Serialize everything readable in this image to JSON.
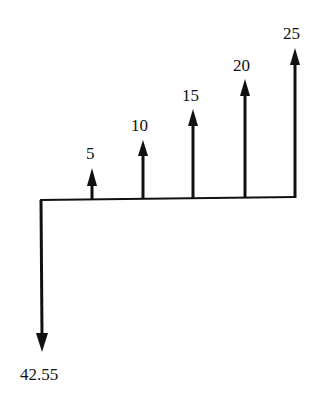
{
  "diagram": {
    "type": "cash-flow-diagram",
    "line_color": "#111111",
    "background": "#ffffff",
    "outflow": {
      "period": 0,
      "amount": 42.55,
      "label": "42.55"
    },
    "inflows": [
      {
        "period": 1,
        "amount": 5,
        "label": "5"
      },
      {
        "period": 2,
        "amount": 10,
        "label": "10"
      },
      {
        "period": 3,
        "amount": 15,
        "label": "15"
      },
      {
        "period": 4,
        "amount": 20,
        "label": "20"
      },
      {
        "period": 5,
        "amount": 25,
        "label": "25"
      }
    ]
  }
}
